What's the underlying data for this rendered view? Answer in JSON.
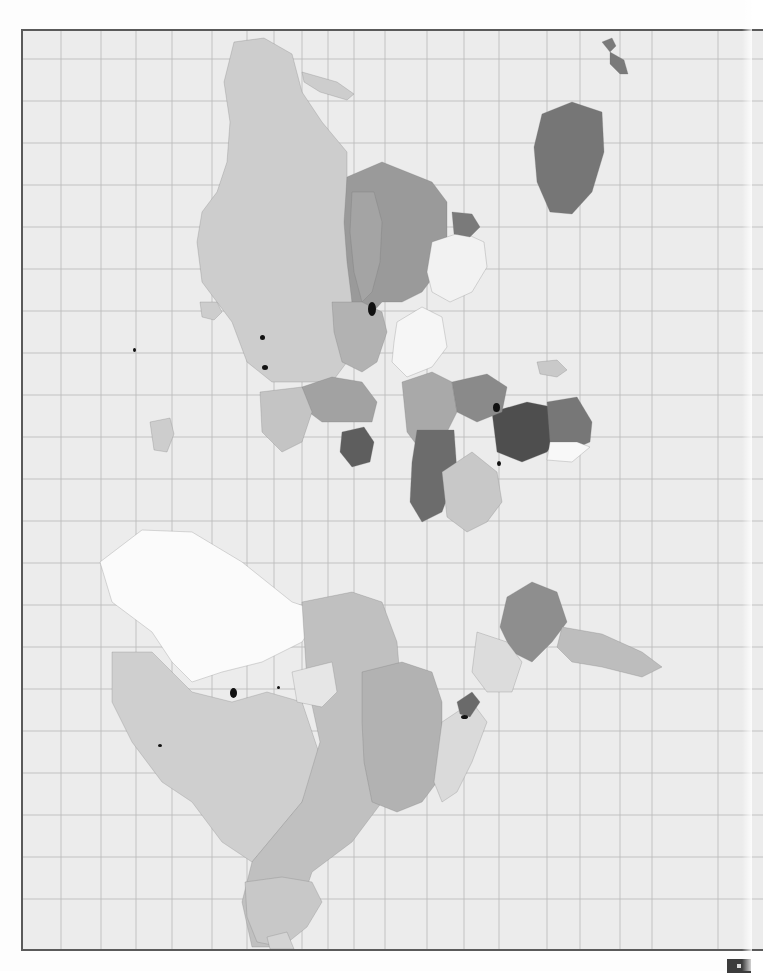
{
  "page": {
    "background": "#fdfdfd",
    "map_background": "#ececec",
    "frame_color": "#5a5a5a",
    "grid_color": "#b9b9b9",
    "border_color": "#6f6f6f"
  },
  "map": {
    "orientation": "rotated 90deg (north to the left)",
    "grid": {
      "vertical_lines_x": [
        59,
        99,
        134,
        170,
        210,
        245,
        272,
        300,
        326,
        352,
        383,
        425,
        462,
        497,
        545,
        578,
        618,
        650,
        716
      ],
      "horizontal_lines_y": [
        57,
        99,
        141,
        183,
        225,
        267,
        309,
        351,
        393,
        435,
        477,
        519,
        561,
        603,
        645,
        687,
        729,
        771,
        813,
        855,
        897
      ]
    },
    "legend_shades": {
      "class_0_white": "#fafafa",
      "class_1_light": "#d6d6d6",
      "class_2_medium_light": "#c2c2c2",
      "class_3_medium": "#a8a8a8",
      "class_4_dark": "#8a8a8a",
      "class_5_darker": "#6e6e6e",
      "class_6_black": "#111111"
    },
    "regions": [
      {
        "name": "russia",
        "fill": "#cdcdcd",
        "d": "M232 40 L262 36 L290 52 L300 90 L320 120 L345 150 L345 200 L355 240 L350 300 L345 360 L330 380 L300 380 L270 380 L245 360 L230 320 L215 300 L200 280 L195 240 L200 210 L215 190 L225 160 L228 120 L222 80 Z"
      },
      {
        "name": "novaya-zemlya",
        "fill": "#cdcdcd",
        "d": "M300 70 L335 80 L352 92 L345 98 L318 90 L302 80 Z"
      },
      {
        "name": "kazakhstan",
        "fill": "#9a9a9a",
        "d": "M345 175 L380 160 L405 170 L430 180 L445 200 L445 240 L435 270 L420 290 L400 300 L380 300 L362 320 L350 300 L345 260 L342 220 Z"
      },
      {
        "name": "kazakh-border-west",
        "fill": "#a4a4a4",
        "d": "M350 190 L372 190 L380 220 L378 260 L370 290 L360 300 L352 270 L348 230 Z"
      },
      {
        "name": "mongolia",
        "fill": "#f2f2f2",
        "d": "M430 240 L460 230 L482 240 L485 265 L470 290 L448 300 L430 290 L425 270 Z"
      },
      {
        "name": "china",
        "fill": "#f6f6f6",
        "d": "M395 320 L420 305 L440 315 L445 345 L430 365 L405 375 L390 360 L392 340 Z"
      },
      {
        "name": "caspian-area",
        "fill": "#7a7a7a",
        "d": "M450 210 L470 212 L478 225 L468 235 L452 232 Z"
      },
      {
        "name": "central-asia-block",
        "fill": "#b2b2b2",
        "d": "M330 300 L360 300 L380 310 L385 330 L375 360 L360 370 L340 360 L332 330 Z"
      },
      {
        "name": "middle-east",
        "fill": "#a2a2a2",
        "d": "M300 385 L330 375 L360 380 L375 400 L370 420 L345 420 L320 420 L300 405 Z"
      },
      {
        "name": "iran",
        "fill": "#5e5e5e",
        "d": "M340 430 L362 425 L372 440 L368 460 L350 465 L338 450 Z"
      },
      {
        "name": "arabia",
        "fill": "#c4c4c4",
        "d": "M258 390 L300 385 L310 410 L300 440 L280 450 L260 430 Z"
      },
      {
        "name": "india",
        "fill": "#a9a9a9",
        "d": "M400 380 L430 370 L450 380 L455 410 L440 440 L420 450 L405 430 Z"
      },
      {
        "name": "africa-sahara",
        "fill": "#6c6c6c",
        "d": "M415 428 L452 428 L455 470 L440 510 L420 520 L408 500 L410 460 Z"
      },
      {
        "name": "africa-west",
        "fill": "#c8c8c8",
        "d": "M440 470 L470 450 L495 470 L500 500 L485 520 L465 530 L445 515 Z"
      },
      {
        "name": "africa-east-dark",
        "fill": "#4e4e4e",
        "d": "M490 410 L525 400 L550 405 L560 430 L545 450 L520 460 L495 450 Z"
      },
      {
        "name": "africa-horn",
        "fill": "#777777",
        "d": "M545 400 L575 395 L590 420 L588 440 L565 450 L548 440 Z"
      },
      {
        "name": "africa-south-light",
        "fill": "#f8f8f8",
        "d": "M548 440 L575 440 L588 445 L570 460 L545 458 Z"
      },
      {
        "name": "africa-central",
        "fill": "#8a8a8a",
        "d": "M450 380 L485 372 L505 385 L500 410 L475 420 L455 410 Z"
      },
      {
        "name": "madagascar",
        "fill": "#c9c9c9",
        "d": "M535 360 L555 358 L565 368 L555 375 L538 372 Z"
      },
      {
        "name": "japan-pacific-dark",
        "fill": "#767676",
        "d": "M540 112 L570 100 L600 110 L602 150 L590 190 L570 212 L548 210 L535 180 L532 145 Z"
      },
      {
        "name": "new-zealand-n",
        "fill": "#7a7a7a",
        "d": "M600 40 L610 36 L614 44 L608 50 Z"
      },
      {
        "name": "new-zealand-s",
        "fill": "#7a7a7a",
        "d": "M608 50 L622 58 L626 72 L618 72 L608 62 Z"
      },
      {
        "name": "iceland-islands",
        "fill": "#cdcdcd",
        "d": "M198 300 L215 300 L220 310 L212 318 L200 315 Z"
      },
      {
        "name": "uk",
        "fill": "#cdcdcd",
        "d": "M148 420 L168 416 L172 432 L165 450 L152 448 Z"
      },
      {
        "name": "greenland",
        "fill": "#fbfbfb",
        "d": "M98 560 L140 528 L190 530 L240 560 L290 600 L320 610 L300 640 L260 660 L220 670 L190 680 L170 660 L150 630 L110 600 Z"
      },
      {
        "name": "canada-archipelago",
        "fill": "#cfcfcf",
        "d": "M110 650 L150 650 L190 690 L230 700 L265 690 L300 700 L320 760 L300 800 L275 830 L250 860 L220 840 L190 800 L160 780 L130 740 L110 700 Z"
      },
      {
        "name": "canada-mainland",
        "fill": "#c0c0c0",
        "d": "M300 600 L350 590 L380 600 L395 640 L400 700 L390 760 L380 800 L350 840 L310 870 L300 900 L270 945 L250 945 L240 900 L250 860 L275 830 L300 800 L318 740 L305 680 Z"
      },
      {
        "name": "usa",
        "fill": "#b2b2b2",
        "d": "M360 670 L400 660 L430 670 L440 700 L440 740 L435 780 L420 800 L395 810 L370 800 L362 760 L360 720 Z"
      },
      {
        "name": "hudson-bay",
        "fill": "#e6e6e6",
        "d": "M290 670 L330 660 L335 690 L320 705 L295 700 Z"
      },
      {
        "name": "mexico-central-america",
        "fill": "#dadada",
        "d": "M440 720 L470 700 L485 720 L470 760 L455 790 L440 800 L432 780 Z"
      },
      {
        "name": "central-america-dark",
        "fill": "#6a6a6a",
        "d": "M455 700 L470 690 L478 700 L468 715 L458 712 Z"
      },
      {
        "name": "south-america-brazil",
        "fill": "#8e8e8e",
        "d": "M505 595 L530 580 L555 590 L565 620 L550 640 L530 660 L510 650 L498 625 Z"
      },
      {
        "name": "south-america-argentina",
        "fill": "#bdbdbd",
        "d": "M560 625 L600 632 L640 650 L660 665 L640 675 L600 665 L570 660 L555 645 Z"
      },
      {
        "name": "south-america-north",
        "fill": "#dcdcdc",
        "d": "M475 630 L505 640 L520 660 L510 690 L485 690 L470 670 Z"
      },
      {
        "name": "australia",
        "fill": "#c8c8c8",
        "d": "M243 880 L280 875 L310 880 L320 900 L305 925 L280 945 L255 940 L245 915 Z"
      },
      {
        "name": "antarctica-peninsula-tip",
        "fill": "#d4d4d4",
        "d": "M265 935 L285 930 L292 947 L268 947 Z"
      }
    ],
    "dark_markers": [
      {
        "name": "black-region-1",
        "x": 366,
        "y": 300,
        "w": 8,
        "h": 14
      },
      {
        "name": "black-region-2",
        "x": 491,
        "y": 401,
        "w": 7,
        "h": 9
      },
      {
        "name": "black-region-3",
        "x": 495,
        "y": 459,
        "w": 4,
        "h": 5
      },
      {
        "name": "black-region-4",
        "x": 258,
        "y": 333,
        "w": 5,
        "h": 5
      },
      {
        "name": "black-region-5",
        "x": 260,
        "y": 363,
        "w": 6,
        "h": 5
      },
      {
        "name": "black-region-6",
        "x": 131,
        "y": 346,
        "w": 3,
        "h": 4
      },
      {
        "name": "black-region-7",
        "x": 228,
        "y": 686,
        "w": 7,
        "h": 10
      },
      {
        "name": "black-region-8",
        "x": 156,
        "y": 742,
        "w": 4,
        "h": 3
      },
      {
        "name": "black-region-9",
        "x": 275,
        "y": 684,
        "w": 3,
        "h": 3
      },
      {
        "name": "black-region-10",
        "x": 459,
        "y": 713,
        "w": 7,
        "h": 4
      }
    ]
  },
  "page_marker": {
    "visible": true,
    "fill": "#3c3c3c"
  }
}
